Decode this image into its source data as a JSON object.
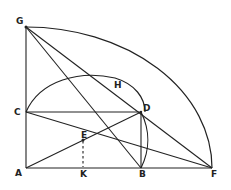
{
  "diagram": {
    "type": "geometric-construction",
    "points": {
      "A": "A",
      "B": "B",
      "C": "C",
      "D": "D",
      "E": "E",
      "F": "F",
      "G": "G",
      "H": "H",
      "K": "K"
    },
    "segments": [
      "AG",
      "AF",
      "CD",
      "BD",
      "GF",
      "GB",
      "CF",
      "AD",
      "EK"
    ],
    "arcs": [
      "GF",
      "CHD",
      "DB"
    ],
    "colors": {
      "ink": "#222222",
      "background": "#ffffff"
    }
  }
}
